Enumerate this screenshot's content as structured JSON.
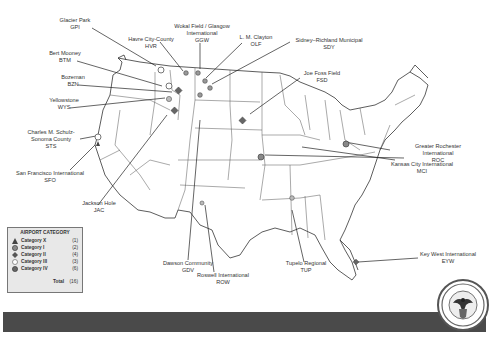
{
  "title_faint": "",
  "legend": {
    "title": "AIRPORT CATEGORY",
    "items": [
      {
        "name": "Category X",
        "count": "(1)",
        "symbol": "triangle-icon"
      },
      {
        "name": "Category I",
        "count": "(2)",
        "symbol": "circle-hatched-icon"
      },
      {
        "name": "Category II",
        "count": "(4)",
        "symbol": "diamond-icon"
      },
      {
        "name": "Category III",
        "count": "(3)",
        "symbol": "circle-open-icon"
      },
      {
        "name": "Category IV",
        "count": "(6)",
        "symbol": "circle-gray-icon"
      }
    ],
    "total_label": "Total",
    "total_count": "(16)"
  },
  "airports": [
    {
      "name": "Glacier Park",
      "code": "GPI"
    },
    {
      "name": "Havre City-County",
      "code": "HVR"
    },
    {
      "name": "Wokal Field / Glasgow International",
      "code": "GGW"
    },
    {
      "name": "L. M. Clayton",
      "code": "OLF"
    },
    {
      "name": "Sidney–Richland Municipal",
      "code": "SDY"
    },
    {
      "name": "Bert Mooney",
      "code": "BTM"
    },
    {
      "name": "Bozeman",
      "code": "BZN"
    },
    {
      "name": "Yellowstone",
      "code": "WYS"
    },
    {
      "name": "Joe Foss Field",
      "code": "FSD"
    },
    {
      "name": "Greater Rochester International",
      "code": "ROC"
    },
    {
      "name": "Charles M. Schulz-Sonoma County",
      "code": "STS"
    },
    {
      "name": "San Francisco International",
      "code": "SFO"
    },
    {
      "name": "Kansas City International",
      "code": "MCI"
    },
    {
      "name": "Jackson Hole",
      "code": "JAC"
    },
    {
      "name": "Dawson Community",
      "code": "GDV"
    },
    {
      "name": "Roswell International",
      "code": "ROW"
    },
    {
      "name": "Tupelo Regional",
      "code": "TUP"
    },
    {
      "name": "Key West International",
      "code": "EYW"
    }
  ],
  "labels": {
    "gpi": [
      "Glacier Park",
      "GPI"
    ],
    "hvr": [
      "Havre City-County",
      "HVR"
    ],
    "ggw": [
      "Wokal Field / Glasgow",
      "International",
      "GGW"
    ],
    "olf": [
      "L. M. Clayton",
      "OLF"
    ],
    "sdy": [
      "Sidney–Richland Municipal",
      "SDY"
    ],
    "btm": [
      "Bert Mooney",
      "BTM"
    ],
    "bzn": [
      "Bozeman",
      "BZN"
    ],
    "wys": [
      "Yellowstone",
      "WYS"
    ],
    "fsd": [
      "Joe Foss Field",
      "FSD"
    ],
    "roc": [
      "Greater Rochester",
      "International",
      "ROC"
    ],
    "sts": [
      "Charles M. Schulz-",
      "Sonoma County",
      "STS"
    ],
    "sfo": [
      "San Francisco International",
      "SFO"
    ],
    "mci": [
      "Kansas City International",
      "MCI"
    ],
    "jac": [
      "Jackson Hole",
      "JAC"
    ],
    "gdv": [
      "Dawson Community",
      "GDV"
    ],
    "row": [
      "Roswell International",
      "ROW"
    ],
    "tup": [
      "Tupelo Regional",
      "TUP"
    ],
    "eyw": [
      "Key West International",
      "EYW"
    ]
  },
  "colors": {
    "footer_bar": "#4a4a4a",
    "legend_bg": "#e8e8e8",
    "marker_gray": "#888888",
    "marker_dark": "#555555"
  }
}
